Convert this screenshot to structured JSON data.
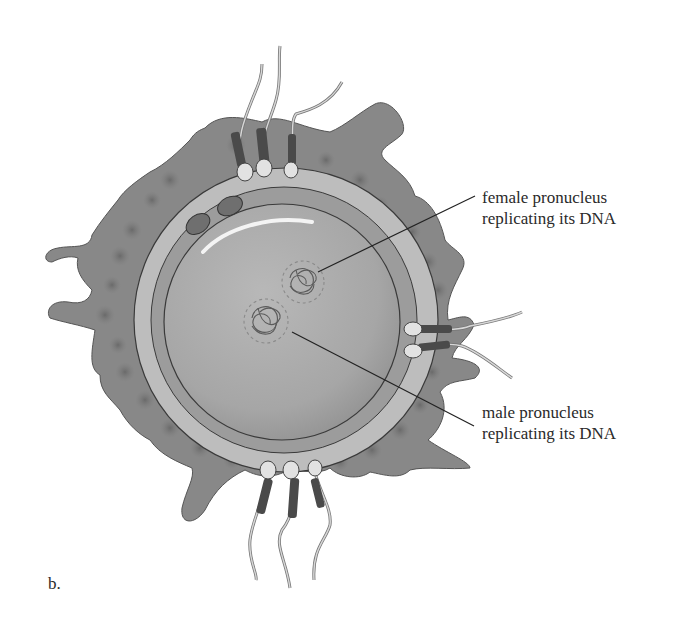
{
  "figure": {
    "panel_letter": "b.",
    "labels": {
      "female": {
        "line1": "female pronucleus",
        "line2": "replicating its DNA"
      },
      "male": {
        "line1": "male pronucleus",
        "line2": "replicating its DNA"
      }
    },
    "structures": [
      "corona-radiata",
      "zona-pellucida",
      "egg-cell-membrane",
      "cytoplasm",
      "polar-bodies",
      "sperm-cells",
      "female-pronucleus",
      "male-pronucleus"
    ],
    "colors": {
      "background": "#ffffff",
      "corona": "#8a8a8a",
      "corona_cell": "#6e6e6e",
      "zona": "#b9b9b9",
      "perivitelline": "#9a9a9a",
      "cytoplasm": "#a9a9a9",
      "outline": "#3a3a3a",
      "sperm_head": "#e2e2e2",
      "text": "#2a2a2a"
    }
  }
}
